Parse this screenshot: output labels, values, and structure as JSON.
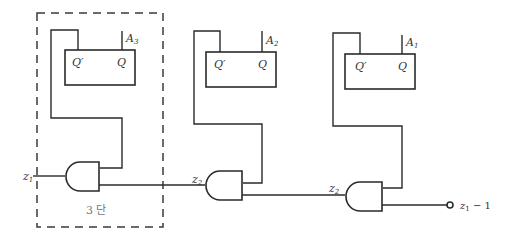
{
  "diagram": {
    "flip_flops": [
      {
        "id": "ff3",
        "output_label": "A",
        "output_sub": "3",
        "q_prime": "Q′",
        "q": "Q"
      },
      {
        "id": "ff2",
        "output_label": "A",
        "output_sub": "2",
        "q_prime": "Q′",
        "q": "Q"
      },
      {
        "id": "ff1",
        "output_label": "A",
        "output_sub": "1",
        "q_prime": "Q′",
        "q": "Q"
      }
    ],
    "gates": [
      {
        "id": "and1",
        "type": "AND",
        "input_label": "z",
        "input_sub": "1"
      },
      {
        "id": "and2",
        "type": "AND",
        "input_label": "z",
        "input_sub": "2"
      },
      {
        "id": "and3",
        "type": "AND",
        "input_label": "z",
        "input_sub": "2"
      }
    ],
    "output": {
      "label": "z",
      "sub": "1",
      "suffix": " − 1"
    },
    "stage_box": {
      "label": "3 단"
    }
  }
}
